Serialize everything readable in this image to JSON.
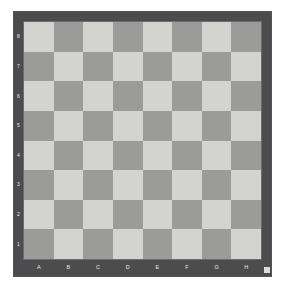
{
  "board": {
    "title": "Chessboard",
    "files": [
      "A",
      "B",
      "C",
      "D",
      "E",
      "F",
      "G",
      "H"
    ],
    "ranks": [
      "8",
      "7",
      "6",
      "5",
      "4",
      "3",
      "2",
      "1"
    ],
    "orientation": "white-bottom",
    "squares_per_side": 8,
    "top_left_square_color": "light",
    "pieces": [],
    "colors": {
      "light_square": "#d3d3d0",
      "dark_square": "#9b9b99",
      "frame": "#4c4c4e",
      "label_text": "#e8e8e6",
      "page_background": "#ffffff",
      "corner_marker": "#dcdcda"
    }
  },
  "chart_data": {
    "type": "heatmap",
    "xlabel": "",
    "ylabel": "",
    "categories": [
      "A",
      "B",
      "C",
      "D",
      "E",
      "F",
      "G",
      "H"
    ],
    "rows": [
      "8",
      "7",
      "6",
      "5",
      "4",
      "3",
      "2",
      "1"
    ],
    "legend": [],
    "grid": true,
    "values": [
      [
        0,
        1,
        0,
        1,
        0,
        1,
        0,
        1
      ],
      [
        1,
        0,
        1,
        0,
        1,
        0,
        1,
        0
      ],
      [
        0,
        1,
        0,
        1,
        0,
        1,
        0,
        1
      ],
      [
        1,
        0,
        1,
        0,
        1,
        0,
        1,
        0
      ],
      [
        0,
        1,
        0,
        1,
        0,
        1,
        0,
        1
      ],
      [
        1,
        0,
        1,
        0,
        1,
        0,
        1,
        0
      ],
      [
        0,
        1,
        0,
        1,
        0,
        1,
        0,
        1
      ],
      [
        1,
        0,
        1,
        0,
        1,
        0,
        1,
        0
      ]
    ]
  }
}
